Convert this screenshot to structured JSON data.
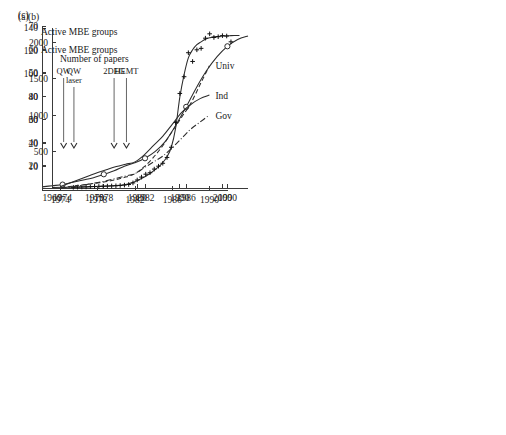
{
  "figure": {
    "background_color": "#ffffff",
    "ink_color": "#2b2b2b",
    "panels": [
      "(a)",
      "(b)",
      "(c)"
    ]
  },
  "chart_data": [
    {
      "id": "panel-a",
      "type": "line",
      "panel_label": "(a)",
      "title": "",
      "annotation_text": "Active MBE groups",
      "xlabel": "",
      "ylabel": "",
      "xlim": [
        1972,
        1992
      ],
      "ylim": [
        0,
        140
      ],
      "xticks": [
        1974,
        1978,
        1982,
        1986,
        1990
      ],
      "xtick_labels": [
        "1974",
        "1978",
        "1982",
        "1986",
        "1990"
      ],
      "yticks": [
        20,
        40,
        60,
        80,
        100,
        120,
        140
      ],
      "ytick_labels": [
        "20",
        "40",
        "60",
        "80",
        "100",
        "120",
        "140"
      ],
      "grid": false,
      "legend": "none",
      "marker": "open-circle",
      "x": [
        1974,
        1978,
        1982,
        1986,
        1990
      ],
      "values": [
        3,
        12,
        26,
        71,
        124
      ],
      "curve_x": [
        1972,
        1973,
        1974,
        1975,
        1976,
        1977,
        1978,
        1979,
        1980,
        1981,
        1982,
        1983,
        1984,
        1985,
        1986,
        1987,
        1988,
        1989,
        1990,
        1991,
        1992
      ],
      "curve_y": [
        1,
        2,
        3,
        5,
        7,
        9,
        12,
        15,
        19,
        22,
        26,
        32,
        41,
        55,
        71,
        88,
        103,
        115,
        124,
        130,
        133
      ],
      "event_markers": [
        {
          "label": "QW",
          "label_lines": [
            "QW"
          ],
          "year": 1974.1
        },
        {
          "label": "QW laser",
          "label_lines": [
            "QW",
            "laser"
          ],
          "year": 1975.1
        },
        {
          "label": "2DEG",
          "label_lines": [
            "2DEG"
          ],
          "year": 1979.0
        },
        {
          "label": "HEMT",
          "label_lines": [
            "HEMT"
          ],
          "year": 1980.2
        }
      ]
    },
    {
      "id": "panel-b",
      "type": "scatter",
      "panel_label": "(b)",
      "title": "",
      "annotation_text": "Number of papers",
      "xlabel": "",
      "ylabel": "",
      "xlim": [
        1960,
        2006
      ],
      "ylim": [
        0,
        2200
      ],
      "xticks": [
        1960,
        1970,
        1980,
        1990,
        2000
      ],
      "xtick_labels": [
        "1960",
        "1970",
        "1980",
        "1990",
        "2000"
      ],
      "yticks": [
        500,
        1000,
        1500,
        2000
      ],
      "ytick_labels": [
        "500",
        "1000",
        "1500",
        "2000"
      ],
      "grid": false,
      "legend": "none",
      "marker": "plus",
      "x": [
        1965,
        1966,
        1967,
        1968,
        1969,
        1970,
        1971,
        1972,
        1973,
        1974,
        1975,
        1976,
        1977,
        1978,
        1979,
        1980,
        1981,
        1982,
        1983,
        1984,
        1985,
        1986,
        1987,
        1988,
        1989,
        1990,
        1991,
        1992,
        1993,
        1994,
        1995,
        1996,
        1997,
        1998,
        1999,
        2000,
        2001,
        2002
      ],
      "values": [
        10,
        12,
        14,
        15,
        18,
        20,
        22,
        24,
        26,
        28,
        30,
        34,
        40,
        48,
        70,
        110,
        150,
        190,
        210,
        260,
        300,
        340,
        420,
        560,
        900,
        1300,
        1530,
        1860,
        1740,
        1900,
        1920,
        2060,
        2120,
        2070,
        2080,
        2095,
        2090,
        2010
      ],
      "curve_x": [
        1960,
        1965,
        1970,
        1974,
        1977,
        1979,
        1981,
        1983,
        1985,
        1986,
        1987,
        1988,
        1989,
        1990,
        1991,
        1992,
        1993,
        1994,
        1995,
        1996,
        1997,
        1998,
        2000,
        2002,
        2004
      ],
      "curve_y": [
        8,
        12,
        20,
        30,
        45,
        75,
        130,
        200,
        290,
        350,
        430,
        560,
        820,
        1250,
        1560,
        1790,
        1900,
        1970,
        2010,
        2045,
        2065,
        2078,
        2090,
        2095,
        2098
      ]
    },
    {
      "id": "panel-c",
      "type": "line",
      "panel_label": "(c)",
      "title": "",
      "annotation_text": "Active MBE groups",
      "xlabel": "",
      "ylabel": "",
      "xlim": [
        1972,
        1992
      ],
      "ylim": [
        0,
        70
      ],
      "xticks": [
        1974,
        1978,
        1982,
        1986,
        1990
      ],
      "xtick_labels": [
        "1974",
        "1978",
        "1982",
        "1986",
        "1990"
      ],
      "yticks": [
        10,
        20,
        30,
        40,
        50,
        60,
        70
      ],
      "ytick_labels": [
        "10",
        "20",
        "30",
        "40",
        "50",
        "60",
        "70"
      ],
      "grid": false,
      "legend": "inline-right",
      "series": [
        {
          "name": "Univ",
          "style": "dashed",
          "x": [
            1974,
            1975,
            1976,
            1977,
            1978,
            1979,
            1980,
            1981,
            1982,
            1983,
            1984,
            1985,
            1986,
            1987,
            1988,
            1989,
            1990
          ],
          "values": [
            1,
            1.5,
            2,
            2.5,
            3,
            3.6,
            4.5,
            5.5,
            7,
            10,
            14,
            19,
            25,
            31,
            37,
            45,
            53
          ]
        },
        {
          "name": "Ind",
          "style": "solid",
          "x": [
            1974,
            1975,
            1976,
            1977,
            1978,
            1979,
            1980,
            1981,
            1982,
            1983,
            1984,
            1985,
            1986,
            1987,
            1988,
            1989,
            1990
          ],
          "values": [
            1.5,
            3,
            4.5,
            6,
            7.5,
            8.8,
            10,
            11,
            12,
            15,
            19,
            23,
            28,
            33,
            36.5,
            39,
            40.5
          ]
        },
        {
          "name": "Gov",
          "style": "dashdot",
          "x": [
            1974,
            1975,
            1976,
            1977,
            1978,
            1979,
            1980,
            1981,
            1982,
            1983,
            1984,
            1985,
            1986,
            1987,
            1988,
            1989,
            1990
          ],
          "values": [
            0.8,
            1.2,
            1.8,
            2.5,
            3.2,
            4,
            5,
            6,
            7,
            9.5,
            12,
            14.5,
            18,
            22,
            26,
            29,
            32
          ]
        }
      ]
    }
  ]
}
